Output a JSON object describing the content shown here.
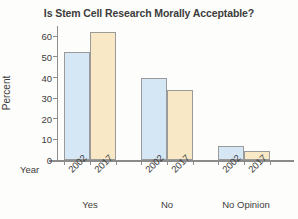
{
  "chart_data": {
    "type": "bar",
    "title": "Is Stem Cell Research Morally Acceptable?",
    "xlabel": "Year",
    "ylabel": "Percent",
    "categories": [
      "Yes",
      "No",
      "No Opinion"
    ],
    "series": [
      {
        "name": "2002",
        "values": [
          52.5,
          40,
          7
        ],
        "color": "#d5e7f4"
      },
      {
        "name": "2017",
        "values": [
          62,
          34,
          4.5
        ],
        "color": "#f9e8c6"
      }
    ],
    "ylim": [
      0,
      65
    ],
    "yticks": [
      0,
      10,
      20,
      30,
      40,
      50,
      60
    ],
    "ytick_labels": [
      "0",
      "10",
      "20",
      "30",
      "40",
      "50",
      "60"
    ],
    "grid": false,
    "legend": "none",
    "group_tick_labels": [
      [
        "2002",
        "2017"
      ],
      [
        "2002",
        "2017"
      ],
      [
        "2002",
        "2017"
      ]
    ]
  },
  "figure": {
    "background_color": "#fdfdfb",
    "axis_color": "#8d8d8d",
    "text_color": "#3c3c3c",
    "bar_outline_color": "#9a9a9a"
  }
}
